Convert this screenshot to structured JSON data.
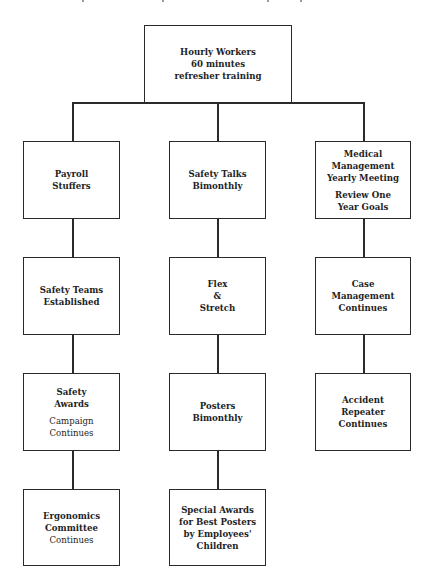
{
  "diagram": {
    "type": "org-chart",
    "root": {
      "id": "root",
      "groups": [
        {
          "lines": [
            "Hourly Workers",
            "60 minutes",
            "refresher training"
          ],
          "weight": "bold"
        }
      ]
    },
    "columns": [
      {
        "name": "left",
        "boxes": [
          {
            "id": "payroll",
            "groups": [
              {
                "lines": [
                  "Payroll",
                  "Stuffers"
                ],
                "weight": "bold"
              }
            ]
          },
          {
            "id": "safety-teams",
            "groups": [
              {
                "lines": [
                  "Safety Teams",
                  "Established"
                ],
                "weight": "bold"
              }
            ]
          },
          {
            "id": "safety-awards",
            "groups": [
              {
                "lines": [
                  "Safety",
                  "Awards"
                ],
                "weight": "bold"
              },
              {
                "lines": [
                  "Campaign",
                  "Continues"
                ],
                "weight": "normal"
              }
            ]
          },
          {
            "id": "ergonomics",
            "groups": [
              {
                "lines": [
                  "Ergonomics",
                  "Committee"
                ],
                "weight": "bold"
              },
              {
                "lines": [
                  "Continues"
                ],
                "weight": "normal"
              }
            ]
          }
        ]
      },
      {
        "name": "middle",
        "boxes": [
          {
            "id": "safety-talks",
            "groups": [
              {
                "lines": [
                  "Safety Talks",
                  "Bimonthly"
                ],
                "weight": "bold"
              }
            ]
          },
          {
            "id": "flex-stretch",
            "groups": [
              {
                "lines": [
                  "Flex",
                  "&",
                  "Stretch"
                ],
                "weight": "bold"
              }
            ]
          },
          {
            "id": "posters",
            "groups": [
              {
                "lines": [
                  "Posters",
                  "Bimonthly"
                ],
                "weight": "bold"
              }
            ]
          },
          {
            "id": "special-awards",
            "groups": [
              {
                "lines": [
                  "Special Awards",
                  "for Best Posters",
                  "by Employees'",
                  "Children"
                ],
                "weight": "bold"
              }
            ]
          }
        ]
      },
      {
        "name": "right",
        "boxes": [
          {
            "id": "medical",
            "groups": [
              {
                "lines": [
                  "Medical",
                  "Management",
                  "Yearly Meeting"
                ],
                "weight": "bold"
              },
              {
                "lines": [
                  "Review One",
                  "Year Goals"
                ],
                "weight": "bold"
              }
            ]
          },
          {
            "id": "case-management",
            "groups": [
              {
                "lines": [
                  "Case",
                  "Management",
                  "Continues"
                ],
                "weight": "bold"
              }
            ]
          },
          {
            "id": "accident-repeater",
            "groups": [
              {
                "lines": [
                  "Accident",
                  "Repeater",
                  "Continues"
                ],
                "weight": "bold"
              }
            ]
          }
        ]
      }
    ]
  }
}
